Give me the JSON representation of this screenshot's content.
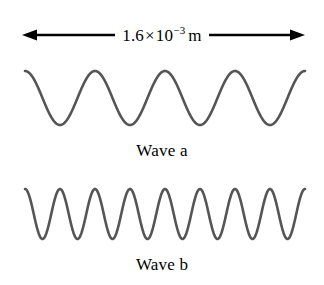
{
  "figure": {
    "background_color": "#ffffff",
    "width": 324,
    "height": 285
  },
  "dimension": {
    "name": "horizontal-span-dimension",
    "mantissa": "1.6",
    "times_symbol": "×",
    "base": "10",
    "exponent": "−3",
    "unit": "m",
    "full_label": "1.6 × 10−3 m",
    "arrow_color": "#000000",
    "arrow_style": "double-headed",
    "left_arrow_x": 22,
    "right_arrow_x": 305
  },
  "waves": [
    {
      "id": "a",
      "caption": "Wave a",
      "cycles": 4,
      "stroke_color": "#555555",
      "stroke_width": 2.6,
      "crest_y": 74,
      "trough_y": 128,
      "amplitude_px": 27,
      "start_x": 25,
      "end_x": 305,
      "starts_at": "crest"
    },
    {
      "id": "b",
      "caption": "Wave b",
      "cycles": 8,
      "stroke_color": "#555555",
      "stroke_width": 2.6,
      "crest_y": 192,
      "trough_y": 243,
      "amplitude_px": 25,
      "start_x": 25,
      "end_x": 305,
      "starts_at": "crest"
    }
  ],
  "chart_data": {
    "type": "line",
    "title": "",
    "xlabel": "",
    "ylabel": "",
    "annotations": [
      "1.6 × 10−3 m"
    ],
    "x_span_meters": 0.0016,
    "series": [
      {
        "name": "Wave a",
        "cycles_over_span": 4,
        "wavelength_meters": 0.0004,
        "relative_frequency": 1
      },
      {
        "name": "Wave b",
        "cycles_over_span": 8,
        "wavelength_meters": 0.0002,
        "relative_frequency": 2
      }
    ]
  }
}
